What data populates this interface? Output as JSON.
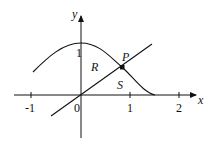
{
  "figure": {
    "axes": {
      "x_label": "x",
      "y_label": "y",
      "x_ticks": [
        {
          "value": -1,
          "label": "-1"
        },
        {
          "value": 0,
          "label": "0"
        },
        {
          "value": 1,
          "label": "1"
        },
        {
          "value": 2,
          "label": "2"
        }
      ],
      "y_ticks": [
        {
          "value": 1,
          "label": "1"
        }
      ]
    },
    "curve": {
      "description": "bell-shaped curve peaking at (0,1), reaching 0 near x≈1.5"
    },
    "line": {
      "description": "straight line through origin"
    },
    "point": {
      "label": "P"
    },
    "regions": {
      "upper": "R",
      "lower": "S"
    },
    "colors": {
      "stroke": "#111111",
      "background": "#ffffff"
    }
  }
}
